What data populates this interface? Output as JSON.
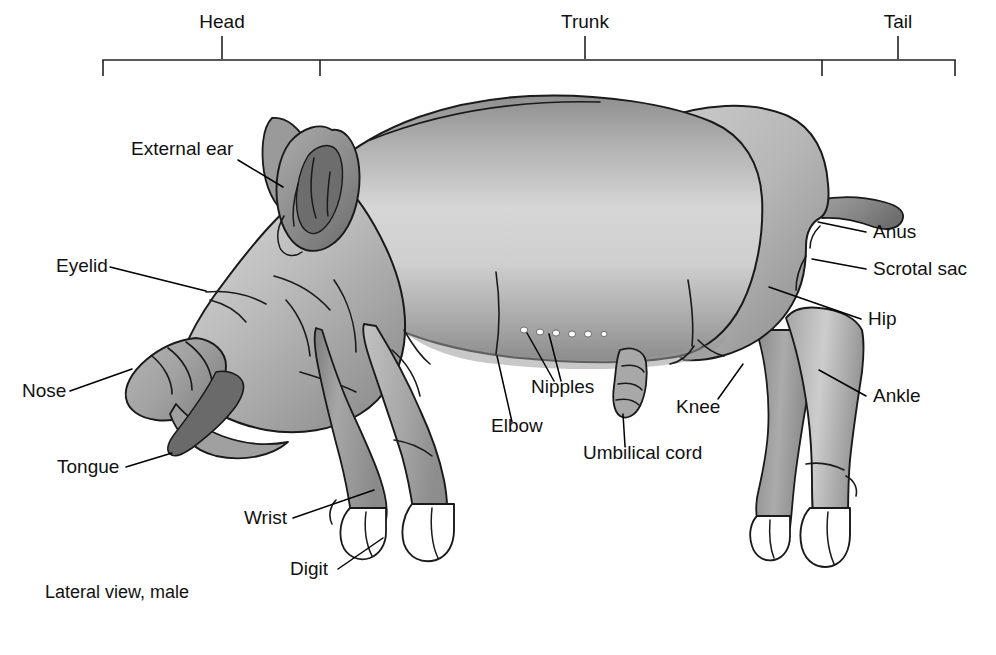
{
  "figure": {
    "caption": "Lateral view, male",
    "title_regions": [
      "Head",
      "Trunk",
      "Tail"
    ]
  },
  "scale_bar": {
    "segments": [
      {
        "name": "Head",
        "label": "Head",
        "label_x": 222,
        "tick_x": 222,
        "start_x": 103,
        "end_x": 320
      },
      {
        "name": "Trunk",
        "label": "Trunk",
        "label_x": 585,
        "tick_x": 585,
        "start_x": 320,
        "end_x": 822
      },
      {
        "name": "Tail",
        "label": "Tail",
        "label_x": 898,
        "tick_x": 898,
        "start_x": 822,
        "end_x": 955
      }
    ],
    "bar_y": 60,
    "label_y": 27
  },
  "labels": [
    {
      "id": "external-ear",
      "text": "External ear",
      "x": 131,
      "y": 155,
      "anchor": "start"
    },
    {
      "id": "eyelid",
      "text": "Eyelid",
      "x": 56,
      "y": 272,
      "anchor": "start"
    },
    {
      "id": "nose",
      "text": "Nose",
      "x": 22,
      "y": 397,
      "anchor": "start"
    },
    {
      "id": "tongue",
      "text": "Tongue",
      "x": 57,
      "y": 473,
      "anchor": "start"
    },
    {
      "id": "wrist",
      "text": "Wrist",
      "x": 244,
      "y": 524,
      "anchor": "start"
    },
    {
      "id": "digit",
      "text": "Digit",
      "x": 290,
      "y": 575,
      "anchor": "start"
    },
    {
      "id": "elbow",
      "text": "Elbow",
      "x": 491,
      "y": 432,
      "anchor": "start"
    },
    {
      "id": "nipples",
      "text": "Nipples",
      "x": 531,
      "y": 393,
      "anchor": "start"
    },
    {
      "id": "umbilical-cord",
      "text": "Umbilical cord",
      "x": 583,
      "y": 459,
      "anchor": "start"
    },
    {
      "id": "knee",
      "text": "Knee",
      "x": 676,
      "y": 413,
      "anchor": "start"
    },
    {
      "id": "anus",
      "text": "Anus",
      "x": 873,
      "y": 238,
      "anchor": "start"
    },
    {
      "id": "scrotal-sac",
      "text": "Scrotal sac",
      "x": 873,
      "y": 275,
      "anchor": "start"
    },
    {
      "id": "hip",
      "text": "Hip",
      "x": 868,
      "y": 325,
      "anchor": "start"
    },
    {
      "id": "ankle",
      "text": "Ankle",
      "x": 873,
      "y": 402,
      "anchor": "start"
    }
  ],
  "colors": {
    "ink": "#1a1a1a",
    "text": "#111111",
    "body_light": "#d9d9d9",
    "body_mid": "#b4b4b4",
    "body_dark": "#8c8c8c",
    "body_darker": "#6e6e6e",
    "hoof": "#ffffff",
    "ear_inner": "#777777",
    "tongue": "#6a6a6a",
    "background": "#ffffff"
  }
}
